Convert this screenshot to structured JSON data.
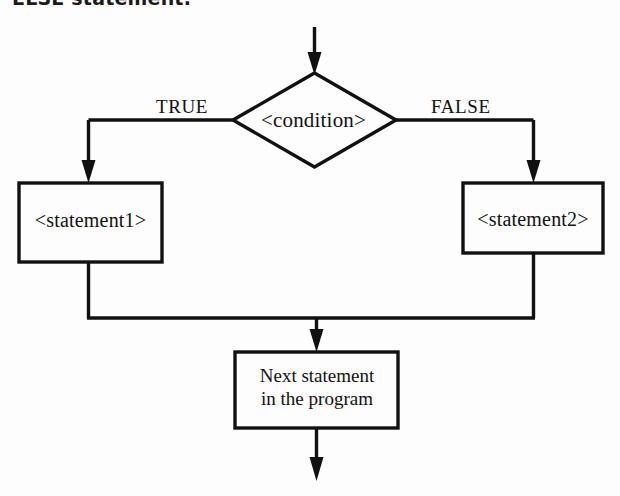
{
  "page": {
    "heading": "ELSE statement.",
    "background_color": "#fdfdfd",
    "ink_color": "#111111",
    "width": 620,
    "height": 496
  },
  "diagram": {
    "type": "flowchart",
    "nodes": {
      "entry_arrow": {
        "name": "entry-arrow",
        "shape": "arrow",
        "direction": "down"
      },
      "decision": {
        "name": "condition-diamond",
        "shape": "diamond",
        "label": "<condition>"
      },
      "true_branch_box": {
        "name": "statement1-box",
        "shape": "rectangle",
        "label": "<statement1>"
      },
      "false_branch_box": {
        "name": "statement2-box",
        "shape": "rectangle",
        "label": "<statement2>"
      },
      "next_box": {
        "name": "next-statement-box",
        "shape": "rectangle",
        "line1": "Next statement",
        "line2": "in the program"
      },
      "exit_arrow": {
        "name": "exit-arrow",
        "shape": "arrow",
        "direction": "down"
      }
    },
    "edge_labels": {
      "true": "TRUE",
      "false": "FALSE"
    }
  }
}
